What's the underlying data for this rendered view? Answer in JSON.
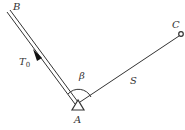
{
  "diagram": {
    "points": {
      "A": {
        "label": "A",
        "x": 77,
        "y": 104,
        "marker": "triangle"
      },
      "B": {
        "label": "B",
        "x": 8,
        "y": 10,
        "marker": "none"
      },
      "C": {
        "label": "C",
        "x": 181,
        "y": 34,
        "marker": "circle"
      }
    },
    "edges": [
      {
        "from": "A",
        "to": "B",
        "style": "double-line",
        "label": "T",
        "label_sub": "0",
        "arrow": "toward B"
      },
      {
        "from": "A",
        "to": "C",
        "style": "single-line",
        "label": "S"
      }
    ],
    "angle": {
      "vertex": "A",
      "between": [
        "B",
        "C"
      ],
      "label": "β"
    },
    "colors": {
      "stroke": "#333333",
      "background": "#ffffff"
    }
  }
}
